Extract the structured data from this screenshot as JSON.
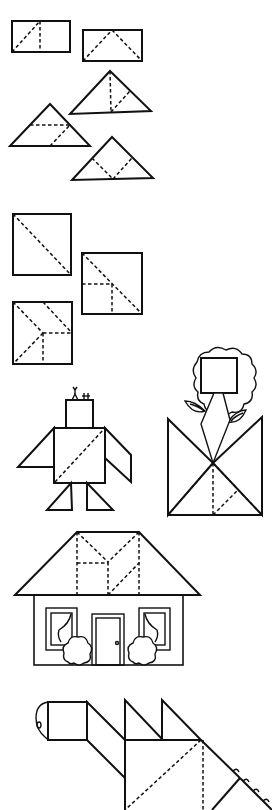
{
  "page": {
    "background": "#ffffff",
    "ink": "#111111",
    "style": "tangram line-art worksheet",
    "sections": [
      {
        "id": "rectangles-and-triangles",
        "figures": [
          "rectangle-two-triangles",
          "rectangle-three-triangles",
          "triangle-split-a",
          "triangle-split-b",
          "triangle-split-c"
        ]
      },
      {
        "id": "squares",
        "figures": [
          "square-diagonal",
          "square-three-parts",
          "square-five-parts"
        ]
      },
      {
        "id": "figures",
        "figures": [
          "bird-figure",
          "flower-in-pot"
        ]
      },
      {
        "id": "house",
        "figures": [
          "house"
        ]
      },
      {
        "id": "dinosaur",
        "figures": [
          "dinosaur"
        ]
      }
    ]
  }
}
